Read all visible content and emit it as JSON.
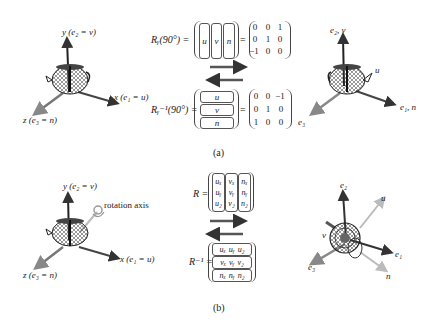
{
  "panel_a": {
    "caption": "(a)",
    "left_axes": {
      "y_label": "y (e₂ = v)",
      "x_label": "x (e₁ = u)",
      "z_label": "z (e₃ = n)"
    },
    "rotation_equation": {
      "lhs": "Rᵧ(90°) =",
      "columns": [
        "u",
        "v",
        "n"
      ],
      "matrix": [
        [
          "0",
          "0",
          "1"
        ],
        [
          "0",
          "1",
          "0"
        ],
        [
          "−1",
          "0",
          "0"
        ]
      ]
    },
    "inverse_equation": {
      "lhs": "Rᵧ⁻¹(90°) =",
      "rows": [
        "u",
        "v",
        "n"
      ],
      "matrix": [
        [
          "0",
          "0",
          "−1"
        ],
        [
          "0",
          "1",
          "0"
        ],
        [
          "1",
          "0",
          "0"
        ]
      ]
    },
    "right_axes": {
      "up_label": "e₂, v",
      "u_label": "u",
      "right_label": "e₁, n",
      "left_label": "e₃"
    }
  },
  "panel_b": {
    "caption": "(b)",
    "left_axes": {
      "y_label": "y (e₂ = v)",
      "x_label": "x (e₁ = u)",
      "z_label": "z (e₃ = n)",
      "rotation_axis_label": "rotation axis"
    },
    "rotation_equation": {
      "lhs": "R =",
      "columns": [
        [
          "uₓ",
          "uᵧ",
          "u₂"
        ],
        [
          "vₓ",
          "vᵧ",
          "v₂"
        ],
        [
          "nₓ",
          "nᵧ",
          "n₂"
        ]
      ]
    },
    "inverse_equation": {
      "lhs": "R⁻¹ =",
      "rows": [
        [
          "uₓ",
          "uᵧ",
          "u₂"
        ],
        [
          "vₓ",
          "vᵧ",
          "v₂"
        ],
        [
          "nₓ",
          "nᵧ",
          "n₂"
        ]
      ]
    },
    "right_axes": {
      "e2_label": "e₂",
      "u_label": "u",
      "v_label": "v",
      "e1_label": "e₁",
      "e3_label": "e₃",
      "n_label": "n"
    }
  }
}
